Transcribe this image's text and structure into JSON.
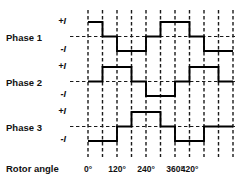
{
  "figure": {
    "axis_label_x": "Rotor angle",
    "amplitude_positive": "+I",
    "amplitude_negative": "-I"
  },
  "phases": [
    {
      "label": "Phase 1"
    },
    {
      "label": "Phase 2"
    },
    {
      "label": "Phase 3"
    }
  ],
  "ticks": [
    {
      "deg": 0,
      "label": "0°",
      "show": true
    },
    {
      "deg": 60,
      "label": "60°",
      "show": false
    },
    {
      "deg": 120,
      "label": "120°",
      "show": true
    },
    {
      "deg": 180,
      "label": "180°",
      "show": false
    },
    {
      "deg": 240,
      "label": "240°",
      "show": true
    },
    {
      "deg": 300,
      "label": "300°",
      "show": false
    },
    {
      "deg": 360,
      "label": "360°",
      "show": true
    },
    {
      "deg": 420,
      "label": "420°",
      "show": true
    },
    {
      "deg": 480,
      "label": "480°",
      "show": false
    },
    {
      "deg": 540,
      "label": "540°",
      "show": false
    },
    {
      "deg": 600,
      "label": "600°",
      "show": false
    }
  ],
  "tick_labels_text": {
    "t0": "0°",
    "t120": "120°",
    "t240": "240°",
    "t360": "360°",
    "t420": "420°"
  },
  "chart_data": {
    "type": "line",
    "xlabel": "Rotor angle",
    "ylabel": "Current",
    "xlim": [
      0,
      600
    ],
    "ylim": [
      -1,
      1
    ],
    "grid": true,
    "legend": "none",
    "x_ticks": [
      0,
      60,
      120,
      180,
      240,
      300,
      360,
      420,
      480,
      540,
      600
    ],
    "x_tick_labels": [
      "0°",
      "",
      "120°",
      "",
      "240°",
      "",
      "360°",
      "420°",
      "",
      "",
      ""
    ],
    "y_ticks": [
      -1,
      0,
      1
    ],
    "y_tick_labels": [
      "-I",
      "",
      "+I"
    ],
    "series": [
      {
        "name": "Phase 1",
        "segments": [
          {
            "from": 0,
            "to": 60,
            "value": 1
          },
          {
            "from": 60,
            "to": 120,
            "value": 0
          },
          {
            "from": 120,
            "to": 240,
            "value": -1
          },
          {
            "from": 240,
            "to": 300,
            "value": 0
          },
          {
            "from": 300,
            "to": 420,
            "value": 1
          },
          {
            "from": 420,
            "to": 480,
            "value": 0
          },
          {
            "from": 480,
            "to": 600,
            "value": -1
          }
        ]
      },
      {
        "name": "Phase 2",
        "segments": [
          {
            "from": 0,
            "to": 60,
            "value": 0
          },
          {
            "from": 60,
            "to": 180,
            "value": 1
          },
          {
            "from": 180,
            "to": 240,
            "value": 0
          },
          {
            "from": 240,
            "to": 360,
            "value": -1
          },
          {
            "from": 360,
            "to": 420,
            "value": 0
          },
          {
            "from": 420,
            "to": 540,
            "value": 1
          },
          {
            "from": 540,
            "to": 600,
            "value": 0
          }
        ]
      },
      {
        "name": "Phase 3",
        "segments": [
          {
            "from": 0,
            "to": 120,
            "value": -1
          },
          {
            "from": 120,
            "to": 180,
            "value": 0
          },
          {
            "from": 180,
            "to": 300,
            "value": 1
          },
          {
            "from": 300,
            "to": 360,
            "value": 0
          },
          {
            "from": 360,
            "to": 480,
            "value": -1
          },
          {
            "from": 480,
            "to": 600,
            "value": 0
          }
        ]
      }
    ]
  }
}
